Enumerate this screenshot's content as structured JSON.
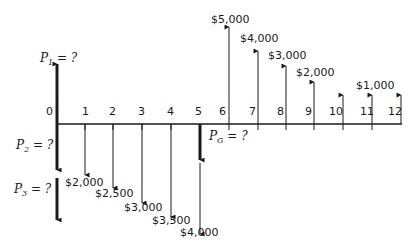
{
  "diagram": {
    "type": "cash-flow-diagram",
    "axis": {
      "periods": [
        "0",
        "1",
        "2",
        "3",
        "4",
        "5",
        "6",
        "7",
        "8",
        "9",
        "10",
        "11",
        "12"
      ]
    },
    "unknowns": {
      "p1": {
        "symbol": "P",
        "subscript": "1",
        "suffix": " = ?"
      },
      "p2": {
        "symbol": "P",
        "subscript": "2",
        "suffix": " = ?"
      },
      "p3": {
        "symbol": "P",
        "subscript": "3",
        "suffix": " = ?"
      },
      "pg": {
        "symbol": "P",
        "subscript": "G",
        "suffix": " = ?"
      }
    },
    "disbursements": [
      {
        "period": 1,
        "amount": "$2,000"
      },
      {
        "period": 2,
        "amount": "$2,500"
      },
      {
        "period": 3,
        "amount": "$3,000"
      },
      {
        "period": 4,
        "amount": "$3,500"
      },
      {
        "period": 5,
        "amount": "$4,000"
      }
    ],
    "receipts": [
      {
        "period": 6,
        "amount": "$5,000"
      },
      {
        "period": 7,
        "amount": "$4,000"
      },
      {
        "period": 8,
        "amount": "$3,000"
      },
      {
        "period": 9,
        "amount": "$2,000"
      },
      {
        "period": 10,
        "amount": ""
      },
      {
        "period": 11,
        "amount": "$1,000"
      },
      {
        "period": 12,
        "amount": ""
      }
    ],
    "colors": {
      "ink": "#1a1a1a",
      "background": "#ffffff"
    }
  }
}
